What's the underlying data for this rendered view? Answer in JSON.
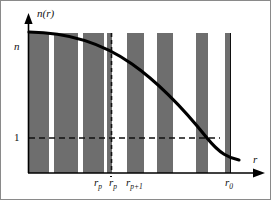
{
  "figure": {
    "caption_alt": "Stepwise refractive index profile n(r) with bars and smooth decreasing curve",
    "background_color": "#ffffff",
    "frame_color": "#8a8a8a",
    "bar_color": "#6e6e6e",
    "curve_color": "#000000",
    "axis_color": "#000000",
    "dash_color": "#111111"
  },
  "axes": {
    "y_axis_label": "n(r)",
    "x_axis_label": "r",
    "y_ticks": [
      {
        "label": "n",
        "value": 1.0
      },
      {
        "label": "1",
        "value": 0.205
      }
    ],
    "x_ticks": [
      {
        "label_base": "r",
        "label_sub": "p",
        "overbar": false,
        "name": "r-p"
      },
      {
        "label_base": "r",
        "label_sub": "p",
        "overbar": true,
        "name": "r-p-bar"
      },
      {
        "label_base": "r",
        "label_sub": "p+1",
        "overbar": false,
        "name": "r-p-plus-1"
      },
      {
        "label_base": "r",
        "label_sub": "0",
        "overbar": false,
        "name": "r-0"
      }
    ]
  },
  "chart_data": {
    "type": "bar",
    "title": "",
    "subtitle": "",
    "xlabel": "r",
    "ylabel": "n(r)",
    "xlim": [
      0,
      1
    ],
    "ylim": [
      0,
      1.07
    ],
    "grid": false,
    "legend": null,
    "categories": [
      "1",
      "2",
      "3",
      "4",
      "5",
      "6",
      "7",
      "8"
    ],
    "values": [
      1.0,
      1.0,
      1.0,
      1.0,
      1.0,
      1.0,
      1.0,
      1.0
    ],
    "bars_px": [
      {
        "x": 27,
        "w": 21
      },
      {
        "x": 53,
        "w": 24
      },
      {
        "x": 82,
        "w": 21
      },
      {
        "x": 106,
        "w": 5
      },
      {
        "x": 126,
        "w": 17
      },
      {
        "x": 156,
        "w": 16
      },
      {
        "x": 195,
        "w": 12
      },
      {
        "x": 224,
        "w": 5
      }
    ],
    "bar_top_px": 32,
    "baseline_px": 172,
    "series": [
      {
        "name": "n(r) continuous profile",
        "type": "line",
        "x": [
          0.0,
          0.08,
          0.17,
          0.26,
          0.35,
          0.44,
          0.53,
          0.62,
          0.71,
          0.8,
          0.89,
          1.0
        ],
        "y": [
          1.0,
          0.995,
          0.982,
          0.962,
          0.933,
          0.896,
          0.85,
          0.793,
          0.726,
          0.645,
          0.548,
          0.415
        ]
      }
    ],
    "reference_lines": [
      {
        "name": "unity-level",
        "orientation": "horizontal",
        "value": 0.205,
        "style": "dashed",
        "label": "1"
      },
      {
        "name": "r-p-bar-line",
        "orientation": "vertical",
        "value": 0.393,
        "style": "dashed",
        "label": "r̄p"
      },
      {
        "name": "r-0-line",
        "orientation": "vertical",
        "value": 0.907,
        "style": "solid",
        "label": "r0"
      }
    ],
    "annotations": [
      {
        "name": "y-axis-title",
        "text": "n(r)"
      },
      {
        "name": "x-axis-title",
        "text": "r"
      }
    ]
  },
  "geometry": {
    "y_axis_x": 27,
    "x_axis_y": 172,
    "y_axis_top": 18,
    "x_axis_right": 262,
    "dashed_h_y": 137,
    "dashed_h_x1": 28,
    "dashed_h_x2": 219,
    "dashed_v_x": 110,
    "dashed_v_y1": 32,
    "dashed_v_y2": 172,
    "solid_v_x": 229,
    "solid_v_y1": 32,
    "solid_v_y2": 172,
    "curve_path": "M 28 31 C 72 31.5, 104 44, 131 63 C 158 82, 186 112, 206 137 C 219 153, 228 157, 238 159"
  }
}
